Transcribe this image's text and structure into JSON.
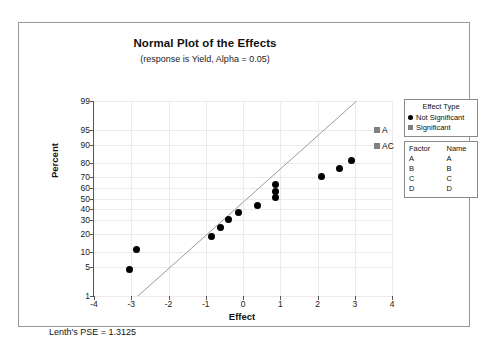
{
  "chart_data": {
    "type": "scatter",
    "title": "Normal Plot of the Effects",
    "subtitle": "(response is Yield, Alpha = 0.05)",
    "xlabel": "Effect",
    "ylabel": "Percent",
    "xlim": [
      -4,
      4
    ],
    "ylim": [
      1,
      99
    ],
    "xticks": [
      -4,
      -3,
      -2,
      -1,
      0,
      1,
      2,
      3,
      4
    ],
    "yticks": [
      1,
      5,
      10,
      20,
      30,
      40,
      50,
      60,
      70,
      80,
      90,
      95,
      99
    ],
    "grid": true,
    "legend_position": "right",
    "series": [
      {
        "name": "Not Significant",
        "marker": "circle",
        "color": "#000000",
        "points": [
          {
            "x": -3.05,
            "y": 4.5
          },
          {
            "x": -2.85,
            "y": 11.0
          },
          {
            "x": -0.85,
            "y": 18.5
          },
          {
            "x": -0.6,
            "y": 24.5
          },
          {
            "x": -0.38,
            "y": 30.5
          },
          {
            "x": -0.12,
            "y": 37.0
          },
          {
            "x": 0.4,
            "y": 43.0
          },
          {
            "x": 0.86,
            "y": 50.5
          },
          {
            "x": 0.88,
            "y": 57.0
          },
          {
            "x": 0.88,
            "y": 63.5
          },
          {
            "x": 2.1,
            "y": 70.0
          },
          {
            "x": 2.6,
            "y": 76.0
          },
          {
            "x": 2.9,
            "y": 82.0
          }
        ]
      },
      {
        "name": "Significant",
        "marker": "square",
        "color": "#808080",
        "points": [
          {
            "x": 3.6,
            "y": 89.5,
            "label": "AC"
          },
          {
            "x": 3.6,
            "y": 95.0,
            "label": "A"
          }
        ]
      }
    ],
    "reference_line": {
      "x1": -2.82,
      "y1": 1,
      "x2": 3.05,
      "y2": 99
    },
    "annotations": [
      "Lenth's PSE = 1.3125"
    ]
  },
  "legend_effect_type": {
    "title": "Effect Type",
    "items": [
      {
        "label": "Not Significant",
        "marker": "circle"
      },
      {
        "label": "Significant",
        "marker": "square"
      }
    ]
  },
  "legend_factor": {
    "headers": [
      "Factor",
      "Name"
    ],
    "rows": [
      {
        "factor": "A",
        "name": "A"
      },
      {
        "factor": "B",
        "name": "B"
      },
      {
        "factor": "C",
        "name": "C"
      },
      {
        "factor": "D",
        "name": "D"
      }
    ]
  },
  "footer": {
    "pse_note": "Lenth's PSE = 1.3125"
  }
}
